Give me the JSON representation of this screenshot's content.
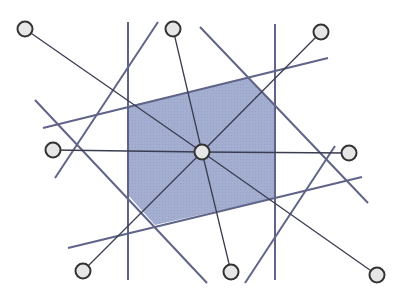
{
  "diagram": {
    "type": "half-plane arrangement with central point",
    "colors": {
      "region_fill": "#a4aed0",
      "boundary_line": "#5f6488",
      "spoke_line": "#3a3d50",
      "node_fill": "#e6e6e6",
      "node_stroke": "#333333"
    },
    "center_node": {
      "x": 202,
      "y": 152
    },
    "outer_nodes": [
      {
        "id": "top-left",
        "x": 25,
        "y": 29
      },
      {
        "id": "top",
        "x": 173,
        "y": 29
      },
      {
        "id": "top-right",
        "x": 321,
        "y": 32
      },
      {
        "id": "left",
        "x": 53,
        "y": 150
      },
      {
        "id": "right",
        "x": 349,
        "y": 153
      },
      {
        "id": "bottom-left",
        "x": 83,
        "y": 271
      },
      {
        "id": "bottom",
        "x": 231,
        "y": 272
      },
      {
        "id": "bottom-right",
        "x": 377,
        "y": 275
      }
    ],
    "boundary_lines": [
      {
        "x1": 128,
        "y1": 22,
        "x2": 128,
        "y2": 280
      },
      {
        "x1": 275,
        "y1": 24,
        "x2": 275,
        "y2": 280
      },
      {
        "x1": 43,
        "y1": 128,
        "x2": 328,
        "y2": 58
      },
      {
        "x1": 68,
        "y1": 248,
        "x2": 362,
        "y2": 177
      },
      {
        "x1": 35,
        "y1": 100,
        "x2": 207,
        "y2": 283
      },
      {
        "x1": 158,
        "y1": 22,
        "x2": 55,
        "y2": 178
      },
      {
        "x1": 200,
        "y1": 27,
        "x2": 368,
        "y2": 203
      },
      {
        "x1": 335,
        "y1": 146,
        "x2": 245,
        "y2": 283
      }
    ],
    "region_polygon": "128,106 248,78 275,104 275,198 155,225 128,195"
  }
}
